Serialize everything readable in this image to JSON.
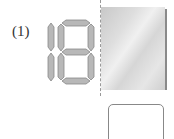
{
  "problem": {
    "label": "(1)",
    "displayed_digits": "18",
    "display_type": "seven-segment",
    "segments_on": {
      "digit_1": [
        "b",
        "c"
      ],
      "digit_8": [
        "a",
        "b",
        "c",
        "d",
        "e",
        "f",
        "g"
      ]
    },
    "mirror": {
      "position": "right",
      "divider": "dashed-line"
    },
    "answer_box": {
      "value": ""
    }
  },
  "colors": {
    "segment_fill": "#b8b8b8",
    "segment_stroke": "#888888",
    "mirror_light": "#f0f0f0",
    "mirror_dark": "#c8c8c8",
    "mirror_edge": "#8a8a8a"
  }
}
